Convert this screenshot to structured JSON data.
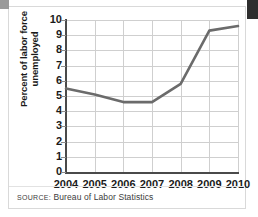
{
  "figure": {
    "source_label": "SOURCE:",
    "source_text": " Bureau of Labor Statistics"
  },
  "chart_data": {
    "type": "line",
    "title": "",
    "xlabel": "",
    "ylabel": "Percent of labor force unemployed",
    "ylabel_line1": "Percent of labor force",
    "ylabel_line2": "unemployed",
    "categories": [
      "2004",
      "2005",
      "2006",
      "2007",
      "2008",
      "2009",
      "2010"
    ],
    "values": [
      5.5,
      5.1,
      4.6,
      4.6,
      5.8,
      9.3,
      9.6
    ],
    "series": [
      {
        "name": "Unemployment rate",
        "values": [
          5.5,
          5.1,
          4.6,
          4.6,
          5.8,
          9.3,
          9.6
        ]
      }
    ],
    "ylim": [
      0,
      10
    ],
    "yticks": [
      10,
      9,
      8,
      7,
      6,
      5,
      4,
      3,
      2,
      1,
      0
    ],
    "ytick_labels": [
      "10",
      "9",
      "8",
      "7",
      "6",
      "5",
      "4",
      "3",
      "2",
      "1",
      "0"
    ],
    "xticks": [
      "2004",
      "2005",
      "2006",
      "2007",
      "2008",
      "2009",
      "2010"
    ],
    "grid": true,
    "legend": false,
    "legend_position": "none",
    "line_color": "#6b6b6b",
    "grid_color": "#cfcfcf",
    "axis_color": "#4a4a4a",
    "text_color": "#1a1a1a"
  }
}
